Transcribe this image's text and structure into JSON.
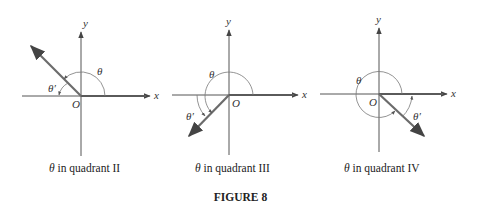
{
  "figure": {
    "title": "FIGURE 8",
    "panels": [
      {
        "caption_symbol": "θ",
        "caption_text": " in quadrant II",
        "axis_x_label": "x",
        "axis_y_label": "y",
        "origin_label": "O",
        "angle_label": "θ",
        "reference_angle_label": "θ′"
      },
      {
        "caption_symbol": "θ",
        "caption_text": " in quadrant III",
        "axis_x_label": "x",
        "axis_y_label": "y",
        "origin_label": "O",
        "angle_label": "θ",
        "reference_angle_label": "θ′"
      },
      {
        "caption_symbol": "θ",
        "caption_text": " in quadrant IV",
        "axis_x_label": "x",
        "axis_y_label": "y",
        "origin_label": "O",
        "angle_label": "θ",
        "reference_angle_label": "θ′"
      }
    ],
    "colors": {
      "axis": "#555555",
      "ray": "#6b6b6b",
      "arc": "#777777",
      "text": "#333333"
    }
  }
}
